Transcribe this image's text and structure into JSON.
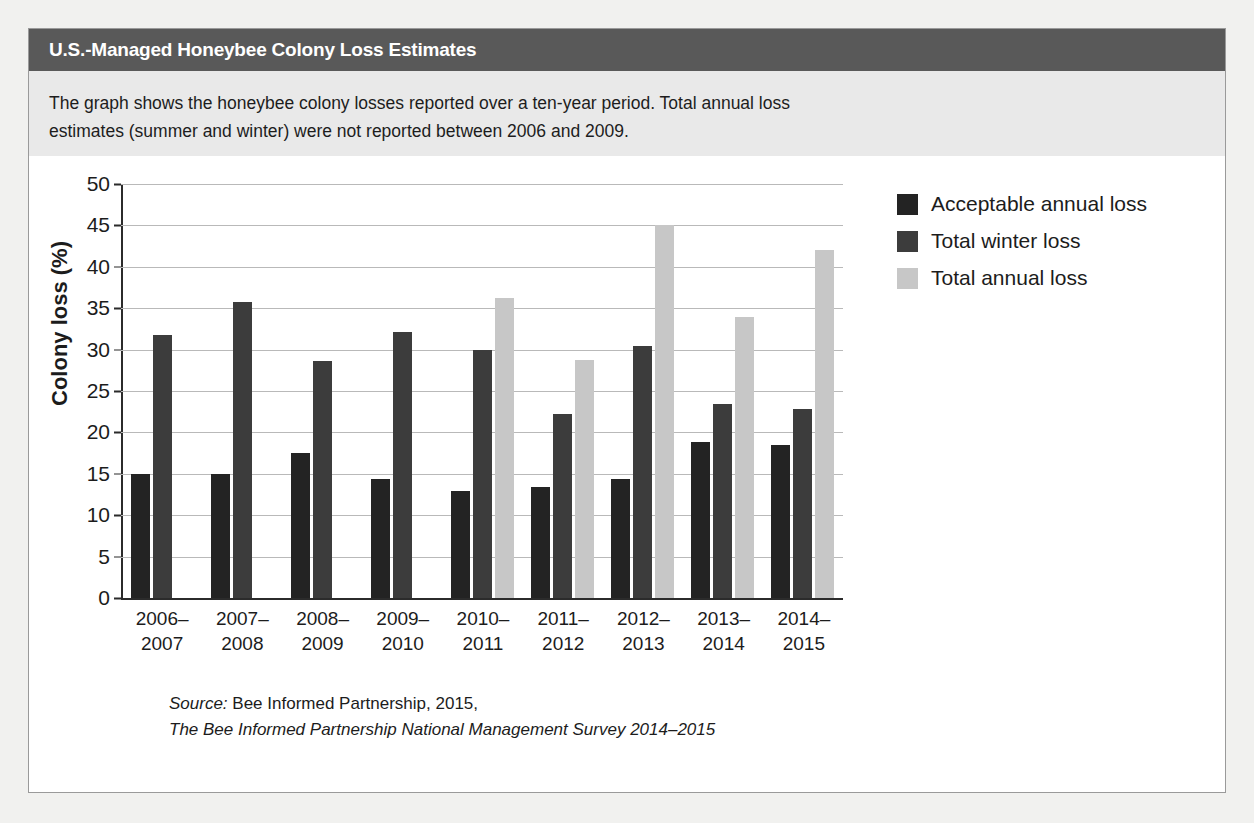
{
  "header": {
    "title": "U.S.-Managed Honeybee Colony Loss Estimates"
  },
  "intro": {
    "text": "The graph shows the honeybee colony losses reported over a ten-year period. Total annual loss estimates (summer and winter) were not reported between 2006 and 2009."
  },
  "source": {
    "label": "Source:",
    "line1": " Bee Informed Partnership, 2015,",
    "line2": "The Bee Informed Partnership National Management Survey 2014–2015"
  },
  "colors": {
    "acceptable_annual_loss": "#232323",
    "total_winter_loss": "#3c3c3c",
    "total_annual_loss": "#c7c7c7",
    "header_bar": "#595959",
    "intro_background": "#e9e9e9",
    "page_background": "#f1f1ef",
    "gridline": "#b9b9b9",
    "axis": "#2b2b2b"
  },
  "chart_data": {
    "type": "bar",
    "title": "U.S.-Managed Honeybee Colony Loss Estimates",
    "xlabel": "",
    "ylabel": "Colony loss (%)",
    "ylim": [
      0,
      50
    ],
    "yticks": [
      0,
      5,
      10,
      15,
      20,
      25,
      30,
      35,
      40,
      45,
      50
    ],
    "ytick_labels": [
      "0",
      "5",
      "10",
      "15",
      "20",
      "25",
      "30",
      "35",
      "40",
      "45",
      "50"
    ],
    "grid": true,
    "legend_position": "right",
    "categories": [
      "2006–2007",
      "2007–2008",
      "2008–2009",
      "2009–2010",
      "2010–2011",
      "2011–2012",
      "2012–2013",
      "2013–2014",
      "2014–2015"
    ],
    "category_lines": [
      [
        "2006–",
        "2007"
      ],
      [
        "2007–",
        "2008"
      ],
      [
        "2008–",
        "2009"
      ],
      [
        "2009–",
        "2010"
      ],
      [
        "2010–",
        "2011"
      ],
      [
        "2011–",
        "2012"
      ],
      [
        "2012–",
        "2013"
      ],
      [
        "2013–",
        "2014"
      ],
      [
        "2014–",
        "2015"
      ]
    ],
    "series": [
      {
        "name": "Acceptable annual loss",
        "color": "#232323",
        "values": [
          15.0,
          15.0,
          17.5,
          14.4,
          12.9,
          13.4,
          14.4,
          18.9,
          18.5
        ]
      },
      {
        "name": "Total winter loss",
        "color": "#3c3c3c",
        "values": [
          31.8,
          35.7,
          28.6,
          32.1,
          30.0,
          22.2,
          30.4,
          23.4,
          22.8
        ]
      },
      {
        "name": "Total annual loss",
        "color": "#c7c7c7",
        "values": [
          null,
          null,
          null,
          null,
          36.2,
          28.7,
          45.0,
          33.9,
          42.0
        ]
      }
    ]
  }
}
